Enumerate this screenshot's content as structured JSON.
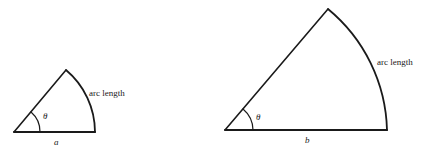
{
  "figures": [
    {
      "id": "small-sector",
      "angle_label": "θ",
      "radius_label": "a",
      "arc_label": "arc length"
    },
    {
      "id": "large-sector",
      "angle_label": "θ",
      "radius_label": "b",
      "arc_label": "arc length"
    }
  ],
  "colors": {
    "stroke": "#1a1a1a",
    "background": "#ffffff"
  }
}
